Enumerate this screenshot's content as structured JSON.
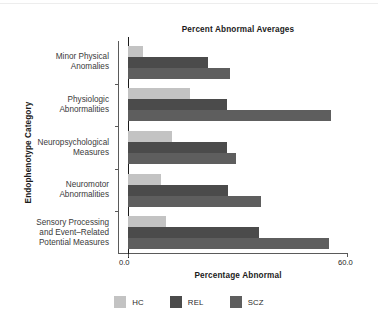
{
  "chart_data": {
    "type": "bar",
    "orientation": "horizontal",
    "title": "Percent Abnormal Averages",
    "xlabel": "Percentage Abnormal",
    "ylabel": "Endophenotype Category",
    "xlim": [
      0.0,
      60.0
    ],
    "xticks": [
      "0.0",
      "60.0"
    ],
    "xtick_values": [
      0.0,
      60.0
    ],
    "grid": false,
    "legend_position": "bottom",
    "reference_line_x": 0.0,
    "categories": [
      "Minor Physical\nAnomalies",
      "Physiologic\nAbnormalities",
      "Neuropsychological\nMeasures",
      "Neuromotor\nAbnormalities",
      "Sensory Processing\nand Event–Related\nPotential Measures"
    ],
    "series": [
      {
        "name": "HC",
        "color": "#c3c3c3",
        "values": [
          4.0,
          17.0,
          12.0,
          9.0,
          10.5
        ]
      },
      {
        "name": "REL",
        "color": "#4b4b4b",
        "values": [
          22.0,
          27.0,
          27.0,
          27.5,
          36.0
        ]
      },
      {
        "name": "SCZ",
        "color": "#5e5e5e",
        "values": [
          28.0,
          55.5,
          29.5,
          36.5,
          55.0
        ]
      }
    ]
  },
  "legend": {
    "items": [
      {
        "label": "HC",
        "color": "#c3c3c3"
      },
      {
        "label": "REL",
        "color": "#4b4b4b"
      },
      {
        "label": "SCZ",
        "color": "#5e5e5e"
      }
    ]
  },
  "axes": {
    "x_tick_labels": [
      "0.0",
      "60.0"
    ],
    "x_axis_title": "Percentage Abnormal",
    "y_axis_title": "Endophenotype Category"
  },
  "title": "Percent Abnormal Averages"
}
